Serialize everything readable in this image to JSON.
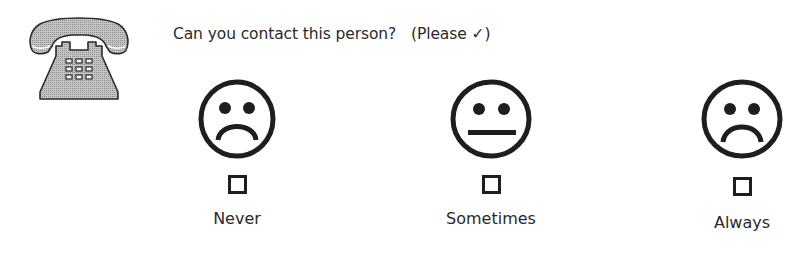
{
  "question": {
    "text": "Can you contact this person?",
    "hint": "(Please ✓)"
  },
  "header_icon": "telephone-icon",
  "options": [
    {
      "label": "Never",
      "face": "sad-face-icon",
      "checked": false
    },
    {
      "label": "Sometimes",
      "face": "neutral-face-icon",
      "checked": false
    },
    {
      "label": "Always",
      "face": "sad-face-icon",
      "checked": false
    }
  ],
  "colors": {
    "ink": "#1e1e1e",
    "phone_fill": "#b4b4b4",
    "text": "#2a2a2a"
  }
}
